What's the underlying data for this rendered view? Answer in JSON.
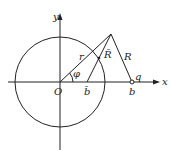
{
  "diagram": {
    "axes": {
      "x_label": "x",
      "y_label": "y"
    },
    "origin_label": "O",
    "labels": {
      "r": "r",
      "R_bar": "R̄",
      "R": "R",
      "phi": "φ",
      "b_bar": "b̄",
      "b": "b",
      "q": "q"
    },
    "colors": {
      "stroke": "#222222",
      "background": "#ffffff"
    }
  }
}
